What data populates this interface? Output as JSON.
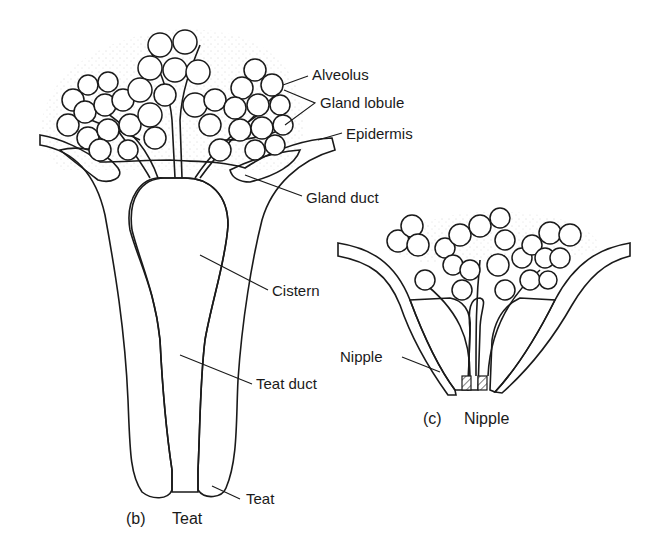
{
  "figure": {
    "panels": [
      {
        "id": "b",
        "caption_letter": "(b)",
        "caption_title": "Teat",
        "labels": {
          "alveolus": "Alveolus",
          "gland_lobule": "Gland lobule",
          "epidermis": "Epidermis",
          "gland_duct": "Gland duct",
          "cistern": "Cistern",
          "teat_duct": "Teat duct",
          "teat": "Teat"
        }
      },
      {
        "id": "c",
        "caption_letter": "(c)",
        "caption_title": "Nipple",
        "labels": {
          "nipple": "Nipple"
        }
      }
    ],
    "colors": {
      "ink": "#1a1a1a",
      "stipple": "#bdbdbd",
      "background": "#ffffff"
    }
  }
}
